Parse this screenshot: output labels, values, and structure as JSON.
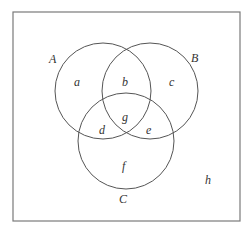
{
  "diagram": {
    "type": "venn",
    "universe_label": "h",
    "sets": [
      {
        "id": "A",
        "label": "A"
      },
      {
        "id": "B",
        "label": "B"
      },
      {
        "id": "C",
        "label": "C"
      }
    ],
    "regions": {
      "only_A": "a",
      "A_and_B_only": "b",
      "only_B": "c",
      "A_and_C_only": "d",
      "B_and_C_only": "e",
      "only_C": "f",
      "A_B_C": "g",
      "outside": "h"
    },
    "colors": {
      "frame": "#7a7a7a",
      "circle_stroke": "#555555",
      "text": "#333333",
      "background": "#ffffff"
    }
  }
}
